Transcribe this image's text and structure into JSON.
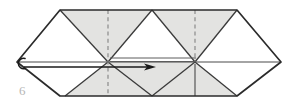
{
  "figure": {
    "step_number": "6",
    "kind": "origami-fold-diagram",
    "colors": {
      "paper_white": "#ffffff",
      "paper_shaded": "#e3e3e1",
      "outline": "#2b2b2b",
      "crease_solid": "#555555",
      "crease_dashed": "#8a8a8a",
      "arrow": "#1a1a1a",
      "step_label": "#b6b6b6",
      "background": "#ffffff"
    },
    "outline": {
      "name": "elongated-hexagon-strip",
      "points": "17,62 60,10 237,10 281,62 237,96 60,96"
    },
    "shaded_triangles": [
      {
        "name": "shaded-triangle-top-left",
        "points": "60,10 152,10 108,62"
      },
      {
        "name": "shaded-triangle-top-right",
        "points": "152,10 237,10 195,62"
      },
      {
        "name": "shaded-triangle-bottom-left",
        "points": "108,62 152,96 65,96"
      },
      {
        "name": "shaded-triangle-bottom-center",
        "points": "108,62 195,62 152,96"
      },
      {
        "name": "shaded-triangle-bottom-right",
        "points": "195,62 237,96 152,96"
      }
    ],
    "white_triangles": [
      {
        "name": "white-triangle-top-far-left",
        "points": "17,62 60,10 60,96"
      },
      {
        "name": "white-triangle-top-center",
        "points": "108,62 152,10 195,62"
      },
      {
        "name": "white-triangle-top-far-right",
        "points": "237,10 281,62 237,96"
      }
    ],
    "crease_lines": [
      {
        "name": "crease-vertical-left-dashed",
        "x1": 108,
        "y1": 10,
        "x2": 108,
        "y2": 96,
        "style": "dashed"
      },
      {
        "name": "crease-vertical-right-upper-dashed",
        "x1": 195,
        "y1": 10,
        "x2": 195,
        "y2": 62,
        "style": "dashed"
      },
      {
        "name": "crease-vertical-right-lower-solid",
        "x1": 195,
        "y1": 62,
        "x2": 195,
        "y2": 96,
        "style": "solid"
      },
      {
        "name": "crease-horizontal-midline",
        "x1": 17,
        "y1": 62,
        "x2": 281,
        "y2": 62,
        "style": "solid"
      },
      {
        "name": "crease-diagonal-a",
        "x1": 60,
        "y1": 10,
        "x2": 108,
        "y2": 62,
        "style": "solid"
      },
      {
        "name": "crease-diagonal-b",
        "x1": 108,
        "y1": 62,
        "x2": 152,
        "y2": 10,
        "style": "solid"
      },
      {
        "name": "crease-diagonal-c",
        "x1": 152,
        "y1": 10,
        "x2": 195,
        "y2": 62,
        "style": "solid"
      },
      {
        "name": "crease-diagonal-d",
        "x1": 195,
        "y1": 62,
        "x2": 237,
        "y2": 10,
        "style": "solid"
      },
      {
        "name": "crease-diagonal-e",
        "x1": 60,
        "y1": 96,
        "x2": 17,
        "y2": 62,
        "style": "solid"
      },
      {
        "name": "crease-diagonal-f",
        "x1": 65,
        "y1": 96,
        "x2": 108,
        "y2": 62,
        "style": "solid"
      },
      {
        "name": "crease-diagonal-g",
        "x1": 108,
        "y1": 62,
        "x2": 152,
        "y2": 96,
        "style": "solid"
      },
      {
        "name": "crease-diagonal-h",
        "x1": 152,
        "y1": 96,
        "x2": 195,
        "y2": 62,
        "style": "solid"
      },
      {
        "name": "crease-diagonal-i",
        "x1": 195,
        "y1": 62,
        "x2": 237,
        "y2": 96,
        "style": "solid"
      }
    ],
    "fold_band": {
      "name": "fold-band-double-line",
      "top_line": {
        "x1": 110,
        "y1": 58,
        "x2": 196,
        "y2": 58
      },
      "bottom_line": {
        "x1": 110,
        "y1": 62,
        "x2": 196,
        "y2": 62
      }
    },
    "arrow": {
      "name": "fold-direction-arrow",
      "from_x": 24,
      "from_y": 67,
      "to_x": 155,
      "to_y": 67,
      "head_length": 11,
      "head_width": 6,
      "description": "solid arrow pointing right indicating fold direction"
    },
    "pivot_marker": {
      "name": "pivot-loop-marker",
      "cx": 20,
      "cy": 63,
      "rx": 5,
      "ry": 5,
      "description": "small open loop at the left point of the strip"
    }
  }
}
